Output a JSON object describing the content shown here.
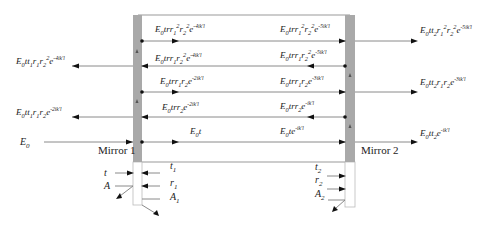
{
  "diagram": {
    "colors": {
      "mirror": "#a9a9a9",
      "line": "#888888",
      "arrow": "#111111",
      "text": "#222222"
    },
    "mirrors": [
      {
        "id": "mirror-1",
        "label": "Mirror 1"
      },
      {
        "id": "mirror-2",
        "label": "Mirror 2"
      }
    ],
    "input": {
      "label": "E0",
      "base": "E",
      "sub": "0"
    },
    "cavity_forward": [
      {
        "row": 0,
        "base": "E",
        "sub": "0",
        "rest": "tr",
        "terms": [
          [
            "r",
            "1",
            "2"
          ],
          [
            "r",
            "2",
            "2"
          ]
        ],
        "exp": "-4ik'l",
        "text": "E0tr1^2r2^2e^-4ik'l"
      },
      {
        "row": 2,
        "base": "E",
        "sub": "0",
        "rest": "tr",
        "terms": [
          [
            "r",
            "1",
            ""
          ],
          [
            "r",
            "2",
            ""
          ]
        ],
        "exp": "-2ik'l",
        "text": "E0tr1r2e^-2ik'l"
      },
      {
        "row": 4,
        "base": "E",
        "sub": "0",
        "rest": "t",
        "terms": [],
        "exp": "",
        "text": "E0t"
      }
    ],
    "cavity_at_mirror2": [
      {
        "row": 0,
        "text": "E0tr1^2r2^2e^-5ik'l",
        "rest": "tr",
        "terms": [
          [
            "r",
            "1",
            "2"
          ],
          [
            "r",
            "2",
            "2"
          ]
        ],
        "exp": "-5ik'l"
      },
      {
        "row": 1,
        "text": "E0tr1r2^2e^-5ik'l",
        "rest": "tr",
        "terms": [
          [
            "r",
            "1",
            ""
          ],
          [
            "r",
            "2",
            "2"
          ]
        ],
        "exp": "-5ik'l"
      },
      {
        "row": 2,
        "text": "E0tr1r2e^-3ik'l",
        "rest": "tr",
        "terms": [
          [
            "r",
            "1",
            ""
          ],
          [
            "r",
            "2",
            ""
          ]
        ],
        "exp": "-3ik'l"
      },
      {
        "row": 3,
        "text": "E0tr2e^-ik'l",
        "rest": "tr",
        "terms": [
          [
            "r",
            "2",
            ""
          ]
        ],
        "exp": "-ik'l"
      },
      {
        "row": 4,
        "text": "E0te^-ik'l",
        "rest": "t",
        "terms": [],
        "exp": "-ik'l"
      }
    ],
    "cavity_backward": [
      {
        "row": 1,
        "text": "E0tr1r2^2e^-4ik'l",
        "rest": "tr",
        "terms": [
          [
            "r",
            "1",
            ""
          ],
          [
            "r",
            "2",
            "2"
          ]
        ],
        "exp": "-4ik'l"
      },
      {
        "row": 3,
        "text": "E0tr2e^-2ik'l",
        "rest": "tr",
        "terms": [
          [
            "r",
            "2",
            ""
          ]
        ],
        "exp": "-2ik'l"
      }
    ],
    "reflected_out": [
      {
        "row": 1,
        "text": "E0tt1r1r2^2e^-4ik'l",
        "rest": "tt",
        "sub1": "1",
        "terms": [
          [
            "r",
            "1",
            ""
          ],
          [
            "r",
            "2",
            "2"
          ]
        ],
        "exp": "-4ik'l"
      },
      {
        "row": 3,
        "text": "E0tt1r1r2e^-2ik'l",
        "rest": "tt",
        "sub1": "1",
        "terms": [
          [
            "r",
            "1",
            ""
          ],
          [
            "r",
            "2",
            ""
          ]
        ],
        "exp": "-2ik'l"
      }
    ],
    "transmitted_out": [
      {
        "row": 0,
        "text": "E0tt2r1^2r2^2e^-5ik'l",
        "rest": "tt",
        "sub1": "2",
        "terms": [
          [
            "r",
            "1",
            "2"
          ],
          [
            "r",
            "2",
            "2"
          ]
        ],
        "exp": "-5ik'l"
      },
      {
        "row": 2,
        "text": "E0tt2r1r2e^-3ik'l",
        "rest": "tt",
        "sub1": "2",
        "terms": [
          [
            "r",
            "1",
            ""
          ],
          [
            "r",
            "2",
            ""
          ]
        ],
        "exp": "-3ik'l"
      },
      {
        "row": 4,
        "text": "E0tt2e^-ik'l",
        "rest": "tt",
        "sub1": "2",
        "terms": [],
        "exp": "-ik'l"
      }
    ],
    "mirror1_coeffs": {
      "outside": [
        {
          "base": "t",
          "sub": ""
        },
        {
          "base": "A",
          "sub": ""
        }
      ],
      "inside": [
        {
          "base": "t",
          "sub": "1"
        },
        {
          "base": "r",
          "sub": "1"
        },
        {
          "base": "A",
          "sub": "1"
        }
      ]
    },
    "mirror2_coeffs": {
      "inside": [
        {
          "base": "t",
          "sub": "2"
        },
        {
          "base": "r",
          "sub": "2"
        },
        {
          "base": "A",
          "sub": "2"
        }
      ]
    }
  }
}
